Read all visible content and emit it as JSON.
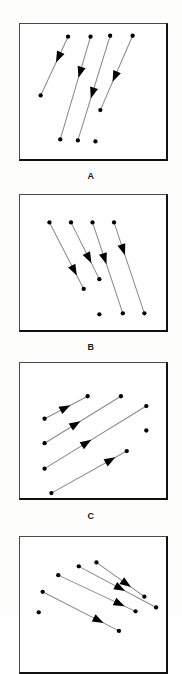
{
  "figure": {
    "background_color": "#fdfdfc",
    "panel_border_color": "#111111",
    "line_color": "#8a8a8a",
    "marker_color": "#000000",
    "width": 182,
    "height": 616
  },
  "panels": [
    {
      "label": "A",
      "label_y": 171,
      "box": {
        "x": 19,
        "y": 23,
        "w": 149,
        "h": 138
      },
      "description": "Four parallel arrows pointing down-left",
      "direction": "down-left",
      "arrow_angle_deg": 248,
      "arrows": [
        {
          "x1": 68,
          "y1": 36,
          "x2": 40,
          "y2": 96,
          "head_t": 0.44
        },
        {
          "x1": 91,
          "y1": 36,
          "x2": 60,
          "y2": 141,
          "head_t": 0.4
        },
        {
          "x1": 111,
          "y1": 35,
          "x2": 78,
          "y2": 142,
          "head_t": 0.6
        },
        {
          "x1": 134,
          "y1": 35,
          "x2": 101,
          "y2": 111,
          "head_t": 0.62
        }
      ],
      "extra_dots": [
        {
          "x": 96,
          "y": 143
        }
      ]
    },
    {
      "label": "B",
      "label_y": 342,
      "box": {
        "x": 19,
        "y": 194,
        "w": 149,
        "h": 138
      },
      "description": "Four parallel arrows pointing down-right",
      "direction": "down-right",
      "arrow_angle_deg": 292,
      "arrows": [
        {
          "x1": 49,
          "y1": 222,
          "x2": 84,
          "y2": 290,
          "head_t": 0.8
        },
        {
          "x1": 71,
          "y1": 222,
          "x2": 100,
          "y2": 280,
          "head_t": 0.72
        },
        {
          "x1": 93,
          "y1": 222,
          "x2": 124,
          "y2": 315,
          "head_t": 0.46
        },
        {
          "x1": 115,
          "y1": 222,
          "x2": 146,
          "y2": 315,
          "head_t": 0.36
        }
      ],
      "extra_dots": [
        {
          "x": 100,
          "y": 316
        }
      ]
    },
    {
      "label": "C",
      "label_y": 511,
      "box": {
        "x": 19,
        "y": 362,
        "w": 149,
        "h": 138
      },
      "description": "Four parallel arrows pointing up-right",
      "direction": "up-right",
      "arrow_angle_deg": 28,
      "arrows": [
        {
          "x1": 44,
          "y1": 419,
          "x2": 88,
          "y2": 396,
          "head_t": 0.6
        },
        {
          "x1": 44,
          "y1": 444,
          "x2": 122,
          "y2": 396,
          "head_t": 0.47
        },
        {
          "x1": 44,
          "y1": 470,
          "x2": 148,
          "y2": 406,
          "head_t": 0.46
        },
        {
          "x1": 51,
          "y1": 495,
          "x2": 128,
          "y2": 452,
          "head_t": 0.85
        }
      ],
      "extra_dots": [
        {
          "x": 148,
          "y": 431
        }
      ]
    },
    {
      "label": "D",
      "label_y": 692,
      "box": {
        "x": 19,
        "y": 536,
        "w": 149,
        "h": 138
      },
      "description": "Four parallel arrows pointing down-right at a shallow angle; panel is cropped by the bottom edge of the image",
      "direction": "down-right",
      "arrow_angle_deg": 330,
      "arrows": [
        {
          "x1": 58,
          "y1": 575,
          "x2": 137,
          "y2": 612,
          "head_t": 0.86
        },
        {
          "x1": 97,
          "y1": 562,
          "x2": 146,
          "y2": 597,
          "head_t": 0.72
        },
        {
          "x1": 42,
          "y1": 592,
          "x2": 120,
          "y2": 632,
          "head_t": 0.8
        },
        {
          "x1": 79,
          "y1": 566,
          "x2": 158,
          "y2": 608,
          "head_t": 0.6
        }
      ],
      "extra_dots": [
        {
          "x": 38,
          "y": 613
        }
      ]
    }
  ]
}
